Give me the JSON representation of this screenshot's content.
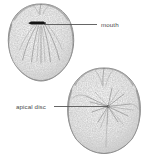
{
  "figure": {
    "kind": "scientific-illustration",
    "background_color": "#ffffff",
    "line_color": "#6d6d6d",
    "label_color": "#4a4a4a",
    "stipple_color": "#8f8f8f",
    "mouth_color": "#151515"
  },
  "labels": [
    {
      "id": "mouth",
      "text": "mouth",
      "text_x": 101,
      "text_y": 27,
      "leader_from_x": 97,
      "leader_from_y": 24.5,
      "leader_to_x": 44,
      "leader_to_y": 24.5
    },
    {
      "id": "apical-disc",
      "text": "apical disc",
      "text_x": 16,
      "text_y": 109,
      "leader_from_x": 54,
      "leader_from_y": 106.5,
      "leader_to_x": 108,
      "leader_to_y": 106.5
    }
  ],
  "specimens": [
    {
      "id": "upper-specimen",
      "view": "oral surface with mouth",
      "center_x": 41,
      "center_y": 42,
      "width": 66,
      "height": 78
    },
    {
      "id": "lower-specimen",
      "view": "aboral surface with apical disc",
      "center_x": 104,
      "center_y": 110,
      "width": 72,
      "height": 86
    }
  ]
}
